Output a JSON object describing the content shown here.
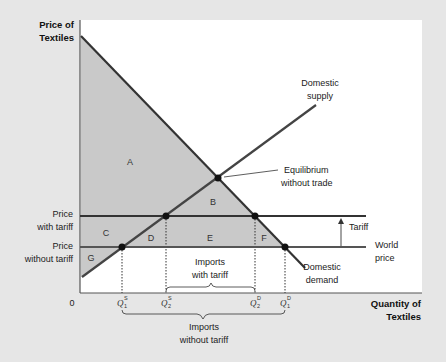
{
  "diagram": {
    "axes": {
      "y_label_line1": "Price of",
      "y_label_line2": "Textiles",
      "x_label_line1": "Quantity of",
      "x_label_line2": "Textiles",
      "origin": "0"
    },
    "price_labels": {
      "with_tariff_line1": "Price",
      "with_tariff_line2": "with tariff",
      "without_tariff_line1": "Price",
      "without_tariff_line2": "without tariff"
    },
    "curves": {
      "supply_line1": "Domestic",
      "supply_line2": "supply",
      "demand_line1": "Domestic",
      "demand_line2": "demand",
      "world_price_line1": "World",
      "world_price_line2": "price",
      "tariff": "Tariff"
    },
    "annotations": {
      "equilibrium_line1": "Equilibrium",
      "equilibrium_line2": "without trade",
      "imports_with_tariff_line1": "Imports",
      "imports_with_tariff_line2": "with tariff",
      "imports_without_tariff_line1": "Imports",
      "imports_without_tariff_line2": "without tariff"
    },
    "regions": {
      "A": "A",
      "B": "B",
      "C": "C",
      "D": "D",
      "E": "E",
      "F": "F",
      "G": "G"
    },
    "quantities": {
      "q1s": {
        "base": "Q",
        "sup": "S",
        "sub": "1"
      },
      "q2s": {
        "base": "Q",
        "sup": "S",
        "sub": "2"
      },
      "q2d": {
        "base": "Q",
        "sup": "D",
        "sub": "2"
      },
      "q1d": {
        "base": "Q",
        "sup": "D",
        "sub": "1"
      }
    },
    "colors": {
      "background": "#e6e6e6",
      "panel": "#ffffff",
      "shade": "#c8c8c8",
      "line": "#333333"
    }
  }
}
